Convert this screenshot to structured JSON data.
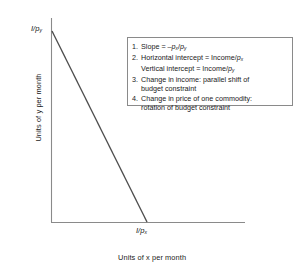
{
  "chart_data": {
    "type": "line",
    "title": "",
    "xlabel": "Units of x per month",
    "ylabel": "Units of y per month",
    "x_intercept_label": "I/p",
    "x_intercept_sub": "x",
    "y_intercept_label": "I/p",
    "y_intercept_sub": "y",
    "grid": false,
    "legend_position": "inside-top-right",
    "series": [
      {
        "name": "budget constraint",
        "points": [
          [
            0,
            1
          ],
          [
            1,
            0
          ]
        ],
        "color": "#4d4d4d",
        "description": "Downward sloping straight budget line from vertical intercept I/p_y to horizontal intercept I/p_x"
      }
    ],
    "axis_color": "#8a8a8a",
    "xlim": [
      0,
      1.8
    ],
    "ylim": [
      0,
      1.05
    ]
  },
  "axes": {
    "y_title": "Units of y per month",
    "x_title": "Units of x per month"
  },
  "intercepts": {
    "vertical": {
      "numerator": "I/p",
      "subscript": "y"
    },
    "horizontal": {
      "numerator": "I/p",
      "subscript": "x"
    }
  },
  "legend": {
    "items": [
      {
        "number": "1.",
        "lines": [
          {
            "parts": [
              {
                "t": "Slope = –",
                "i": false
              },
              {
                "t": "p",
                "i": true
              },
              {
                "t": "x",
                "sub": true
              },
              {
                "t": "/",
                "i": false
              },
              {
                "t": "p",
                "i": true
              },
              {
                "t": "y",
                "sub": true
              }
            ],
            "text": "Slope = –px/py"
          }
        ]
      },
      {
        "number": "2.",
        "lines": [
          {
            "parts": [
              {
                "t": "Horizontal intercept = Income/",
                "i": false
              },
              {
                "t": "p",
                "i": true
              },
              {
                "t": "x",
                "sub": true
              }
            ],
            "text": "Horizontal intercept = Income/px"
          },
          {
            "parts": [
              {
                "t": "Vertical intercept = Income/",
                "i": false
              },
              {
                "t": "p",
                "i": true
              },
              {
                "t": "y",
                "sub": true
              }
            ],
            "text": "Vertical intercept = Income/py"
          }
        ]
      },
      {
        "number": "3.",
        "lines": [
          {
            "parts": [
              {
                "t": "Change in income: parallel shift of",
                "i": false
              }
            ],
            "text": "Change in income: parallel shift of"
          },
          {
            "parts": [
              {
                "t": "budget constraint",
                "i": false
              }
            ],
            "text": "budget constraint"
          }
        ]
      },
      {
        "number": "4.",
        "lines": [
          {
            "parts": [
              {
                "t": "Change in price of one commodity:",
                "i": false
              }
            ],
            "text": "Change in price of one commodity:"
          },
          {
            "parts": [
              {
                "t": "rotation of budget constraint",
                "i": false
              }
            ],
            "text": "rotation of budget constraint"
          }
        ]
      }
    ]
  },
  "colors": {
    "axis": "#8a8a8a",
    "line": "#4d4d4d",
    "legend_border": "#8a8a8a",
    "text": "#1a1a1a",
    "background": "#ffffff"
  }
}
